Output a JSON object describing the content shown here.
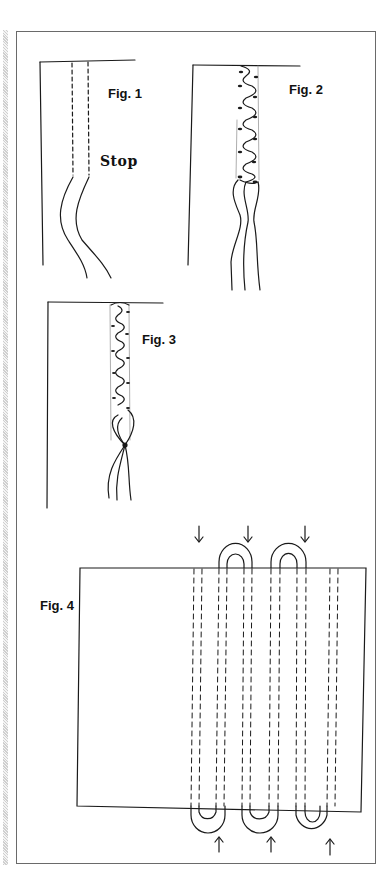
{
  "document": {
    "type": "sewing instruction illustration page",
    "figures": [
      {
        "id": "fig1",
        "label": "Fig. 1",
        "annotation": "Stop"
      },
      {
        "id": "fig2",
        "label": "Fig. 2"
      },
      {
        "id": "fig3",
        "label": "Fig. 3"
      },
      {
        "id": "fig4",
        "label": "Fig. 4",
        "arrows_down": 3,
        "arrows_up": 3,
        "loops_top": 2,
        "loops_bottom": 3
      }
    ]
  },
  "colors": {
    "ink": "#1a1a1a",
    "frame": "#6a6a6a",
    "background": "#ffffff"
  }
}
